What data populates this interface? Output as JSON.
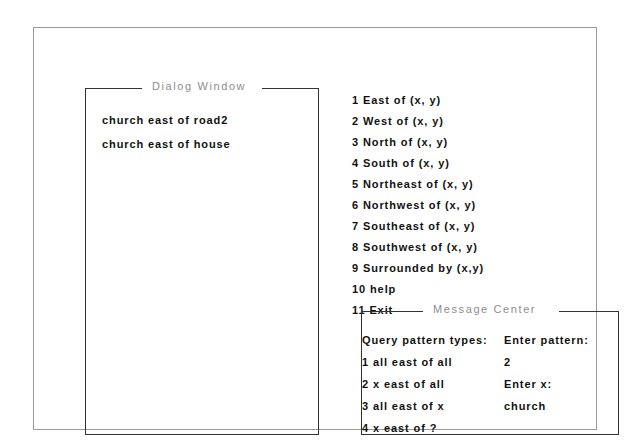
{
  "dialog_window": {
    "title": "Dialog Window",
    "lines": [
      "church east of road2",
      "church east of house"
    ]
  },
  "menu": {
    "items": [
      "1 East of (x, y)",
      "2 West of (x, y)",
      "3 North of (x, y)",
      "4 South of (x, y)",
      "5 Northeast of (x, y)",
      "6 Northwest of (x, y)",
      "7 Southeast of (x, y)",
      "8 Southwest of (x, y)",
      "9 Surrounded by (x,y)",
      "10 help",
      "11 Exit"
    ]
  },
  "message_center": {
    "title": "Message Center",
    "query_heading": "Query pattern types:",
    "query_options": [
      "1 all east of all",
      "2 x east of all",
      "3 all east of x",
      "4 x east of ?"
    ],
    "enter_pattern_label": "Enter pattern:",
    "enter_pattern_value": "2",
    "enter_x_label": "Enter x:",
    "enter_x_value": "church"
  },
  "colors": {
    "background": "#ffffff",
    "outer_border": "#9a9a9a",
    "panel_border": "#333333",
    "body_text": "#111111",
    "frame_title_text": "#8d8d8d"
  }
}
